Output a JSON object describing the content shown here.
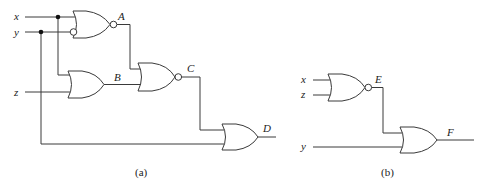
{
  "diagram": {
    "type": "logic-circuit",
    "panels": [
      {
        "id": "a",
        "caption": "(a)",
        "inputs": [
          "x",
          "y",
          "z"
        ],
        "gates": [
          {
            "name": "A",
            "type": "NOR",
            "inputs": [
              "x",
              "y'"
            ],
            "output_label": "A"
          },
          {
            "name": "B",
            "type": "OR",
            "inputs": [
              "x",
              "z"
            ],
            "output_label": "B"
          },
          {
            "name": "C",
            "type": "NOR",
            "inputs": [
              "A",
              "B"
            ],
            "output_label": "C"
          },
          {
            "name": "D",
            "type": "OR",
            "inputs": [
              "C",
              "y"
            ],
            "output_label": "D"
          }
        ]
      },
      {
        "id": "b",
        "caption": "(b)",
        "inputs": [
          "x",
          "z",
          "y"
        ],
        "gates": [
          {
            "name": "E",
            "type": "NOR",
            "inputs": [
              "x",
              "z"
            ],
            "output_label": "E"
          },
          {
            "name": "F",
            "type": "OR",
            "inputs": [
              "E",
              "y"
            ],
            "output_label": "F"
          }
        ]
      }
    ]
  },
  "labels": {
    "a_x": "x",
    "a_y": "y",
    "a_z": "z",
    "A": "A",
    "B": "B",
    "C": "C",
    "D": "D",
    "b_x": "x",
    "b_z": "z",
    "b_y": "y",
    "E": "E",
    "F": "F"
  },
  "captions": {
    "a": "(a)",
    "b": "(b)"
  }
}
